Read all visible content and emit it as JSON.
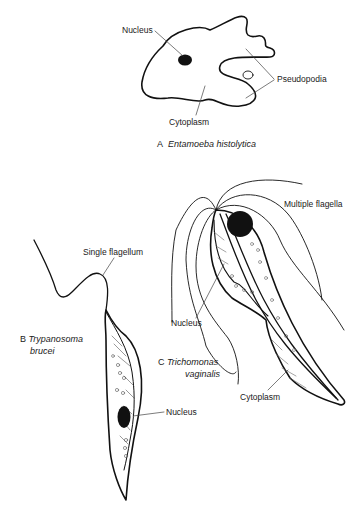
{
  "panels": [
    {
      "letter": "A",
      "organism": "Entamoeba histolytica",
      "labels": {
        "nucleus": "Nucleus",
        "pseudopodia": "Pseudopodia",
        "cytoplasm": "Cytoplasm"
      }
    },
    {
      "letter": "B",
      "organism_line1": "Trypanosoma",
      "organism_line2": "brucei",
      "labels": {
        "flagellum": "Single flagellum",
        "nucleus": "Nucleus"
      }
    },
    {
      "letter": "C",
      "organism_line1": "Trichomonas",
      "organism_line2": "vaginalis",
      "labels": {
        "flagella": "Multiple flagella",
        "nucleus": "Nucleus",
        "cytoplasm": "Cytoplasm"
      }
    }
  ]
}
